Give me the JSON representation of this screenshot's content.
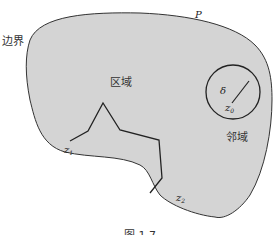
{
  "figure": {
    "labels": {
      "boundary": "边界",
      "point_p": "P",
      "region": "区域",
      "neighborhood": "邻域",
      "delta": "δ",
      "z0": "z",
      "z0_sub": "0",
      "z1": "z",
      "z1_sub": "1",
      "z2": "z",
      "z2_sub": "2",
      "caption": "图 1.7"
    },
    "colors": {
      "region_fill": "#d4d4d4",
      "outline": "#333333",
      "background": "#ffffff"
    },
    "polyline_points": [
      [
        34,
        142
      ],
      [
        88,
        131
      ],
      [
        103,
        101
      ],
      [
        120,
        130
      ],
      [
        160,
        138
      ],
      [
        161,
        181
      ],
      [
        152,
        196
      ]
    ],
    "circle": {
      "cx": 233,
      "cy": 92,
      "r": 27
    }
  }
}
